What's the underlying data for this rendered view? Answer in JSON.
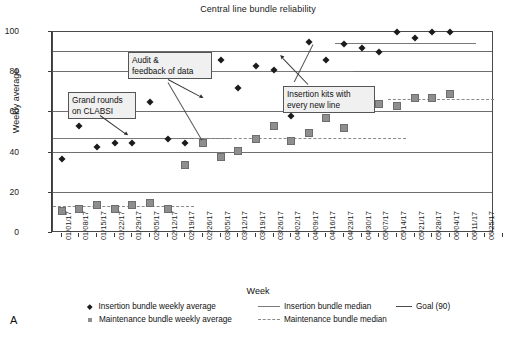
{
  "chart": {
    "title": "Central line bundle reliability",
    "xlabel": "Week",
    "ylabel": "Weekly average",
    "panel_letter": "A"
  },
  "legend": {
    "items": [
      {
        "marker": "diamond-marker",
        "label": "Insertion bundle weekly average"
      },
      {
        "marker": "square-marker",
        "label": "Maintenance bundle weekly average"
      },
      {
        "marker": "solid-line",
        "label": "Insertion bundle median"
      },
      {
        "marker": "dashed-line",
        "label": "Maintenance bundle median"
      },
      {
        "marker": "solid-line-dark",
        "label": "Goal (90)"
      }
    ]
  },
  "annotations": [
    {
      "name": "grand-rounds-annotation",
      "text": "Grand rounds\non CLABSI"
    },
    {
      "name": "audit-feedback-annotation",
      "text": "Audit &\nfeedback of data"
    },
    {
      "name": "insertion-kits-annotation",
      "text": "Insertion kits with\nevery new line"
    }
  ],
  "chart_data": {
    "type": "scatter",
    "title": "Central line bundle reliability",
    "xlabel": "Week",
    "ylabel": "Weekly average",
    "ylim": [
      0,
      100
    ],
    "yticks": [
      0,
      20,
      40,
      60,
      80,
      100
    ],
    "grid": true,
    "legend_position": "bottom",
    "categories": [
      "01/01/17",
      "01/08/17",
      "01/15/17",
      "01/22/17",
      "01/29/17",
      "02/05/17",
      "02/12/17",
      "02/19/17",
      "02/26/17",
      "03/05/17",
      "03/12/17",
      "03/19/17",
      "03/26/17",
      "04/02/17",
      "04/09/17",
      "04/16/17",
      "04/23/17",
      "04/30/17",
      "05/07/17",
      "05/14/17",
      "05/21/17",
      "05/28/17",
      "06/04/17",
      "06/11/17",
      "06/25/17"
    ],
    "series": [
      {
        "name": "Insertion bundle weekly average",
        "marker": "diamond",
        "values": [
          37,
          53,
          43,
          45,
          45,
          65,
          47,
          45,
          84,
          86,
          72,
          83,
          81,
          58,
          95,
          86,
          94,
          92,
          90,
          100,
          97,
          100,
          100,
          null,
          null
        ]
      },
      {
        "name": "Maintenance bundle weekly average",
        "marker": "square",
        "values": [
          11,
          12,
          14,
          12,
          14,
          15,
          12,
          34,
          45,
          38,
          41,
          47,
          53,
          46,
          50,
          57,
          52,
          66,
          64,
          63,
          67,
          67,
          69,
          null,
          null
        ]
      }
    ],
    "reference_lines": [
      {
        "name": "goal-line",
        "label": "Goal (90)",
        "value": 90,
        "style": "solid",
        "span": "full"
      },
      {
        "name": "insertion-median-segment-1",
        "label": "Insertion bundle median",
        "value": 47,
        "style": "solid",
        "x_from": "01/01/17",
        "x_to": "03/05/17"
      },
      {
        "name": "insertion-median-segment-2",
        "label": "Insertion bundle median",
        "value": 80,
        "style": "solid",
        "x_from": "02/26/17",
        "x_to": "04/23/17"
      },
      {
        "name": "insertion-median-segment-3",
        "label": "Insertion bundle median",
        "value": 94,
        "style": "solid",
        "x_from": "04/23/17",
        "x_to": "06/11/17"
      },
      {
        "name": "maintenance-median-segment-1",
        "label": "Maintenance bundle median",
        "value": 13,
        "style": "dashed",
        "x_from": "01/01/17",
        "x_to": "02/19/17"
      },
      {
        "name": "maintenance-median-segment-2",
        "label": "Maintenance bundle median",
        "value": 47,
        "style": "dashed",
        "x_from": "02/26/17",
        "x_to": "05/14/17"
      },
      {
        "name": "maintenance-median-segment-3",
        "label": "Maintenance bundle median",
        "value": 66,
        "style": "dashed",
        "x_from": "05/14/17",
        "x_to": "06/25/17"
      }
    ],
    "annotations": [
      {
        "text": "Grand rounds on CLABSI",
        "points_to": "02/19/17"
      },
      {
        "text": "Audit & feedback of data",
        "points_to": "02/26/17"
      },
      {
        "text": "Insertion kits with every new line",
        "points_to": "04/23/17"
      }
    ]
  }
}
